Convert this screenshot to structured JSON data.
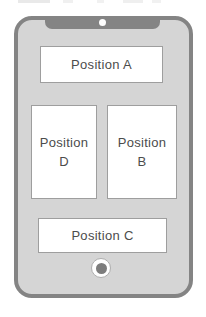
{
  "colors": {
    "frame": "#848484",
    "screen": "#d5d5d5",
    "slot_bg": "#ffffff",
    "slot_border": "#9e9e9e",
    "text": "#4c4c4c",
    "camera_dot": "#fdfdfd",
    "home_ring_border": "#aeaeae",
    "home_dot": "#7d7d7d"
  },
  "icons": {
    "camera": "white-dot",
    "home_button": "ring-with-dark-dot"
  },
  "phone": {
    "slot_top": {
      "label": "Position A"
    },
    "slot_left": {
      "line1": "Position",
      "line2": "D"
    },
    "slot_right": {
      "line1": "Position",
      "line2": "B"
    },
    "slot_bottom": {
      "label": "Position C"
    }
  }
}
